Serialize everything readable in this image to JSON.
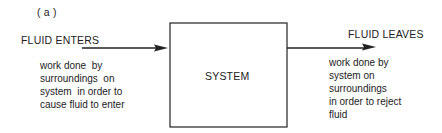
{
  "figure_label": "( a )",
  "inlet": {
    "label": "FLUID ENTERS",
    "note": "work done  by\nsurroundings  on\nsystem  in order to\ncause fluid to enter"
  },
  "system": {
    "label": "SYSTEM"
  },
  "outlet": {
    "label": "FLUID LEAVES",
    "note": "work done by\nsystem on\nsurroundings\nin order to reject\nfluid"
  }
}
